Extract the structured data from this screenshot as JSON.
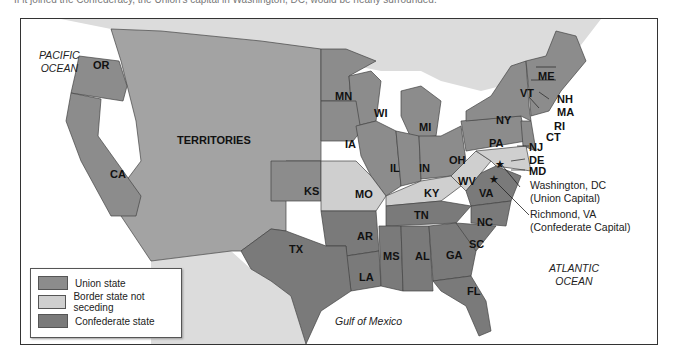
{
  "caption": "If it joined the Confederacy, the Union's capital in Washington, DC, would be nearly surrounded.",
  "colors": {
    "union": "#8c8c8c",
    "border_state": "#cfcfcf",
    "confederate": "#7a7a7a",
    "territories": "#a3a3a3",
    "foreign": "#dcdcdc",
    "water": "#ffffff"
  },
  "oceans": {
    "pacific": [
      "PACIFIC",
      "OCEAN"
    ],
    "atlantic": [
      "ATLANTIC",
      "OCEAN"
    ],
    "gulf": "Gulf of Mexico"
  },
  "states": {
    "OR": "OR",
    "CA": "CA",
    "TERRITORIES": "TERRITORIES",
    "MN": "MN",
    "WI": "WI",
    "MI": "MI",
    "IA": "IA",
    "IL": "IL",
    "IN": "IN",
    "OH": "OH",
    "PA": "PA",
    "NY": "NY",
    "VT": "VT",
    "ME": "ME",
    "NH": "NH",
    "MA": "MA",
    "RI": "RI",
    "CT": "CT",
    "NJ": "NJ",
    "DE": "DE",
    "MD": "MD",
    "KS": "KS",
    "MO": "MO",
    "KY": "KY",
    "WV": "WV",
    "VA": "VA",
    "NC": "NC",
    "SC": "SC",
    "TN": "TN",
    "AR": "AR",
    "TX": "TX",
    "LA": "LA",
    "MS": "MS",
    "AL": "AL",
    "GA": "GA",
    "FL": "FL"
  },
  "capitals": {
    "union": {
      "name": "Washington, DC",
      "note": "(Union Capital)"
    },
    "confederate": {
      "name": "Richmond, VA",
      "note": "(Confederate Capital)"
    }
  },
  "legend": {
    "items": [
      {
        "label": "Union state",
        "color": "#8c8c8c"
      },
      {
        "label": "Border state not seceding",
        "color": "#cfcfcf"
      },
      {
        "label": "Confederate state",
        "color": "#7a7a7a"
      }
    ]
  }
}
